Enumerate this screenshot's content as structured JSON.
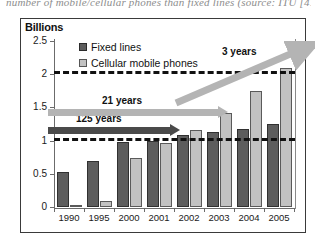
{
  "caption": "number of mobile/cellular phones than fixed lines (source: ITU [41])",
  "chart_data": {
    "type": "bar",
    "title": "",
    "ylabel": "Billions",
    "xlabel": "",
    "ylim": [
      0,
      2.5
    ],
    "yticks": [
      "0",
      "0.5",
      "1",
      "1.5",
      "2",
      "2.5"
    ],
    "ytick_values": [
      0,
      0.5,
      1,
      1.5,
      2,
      2.5
    ],
    "grid": false,
    "legend_position": "top-left-inside",
    "categories": [
      "1990",
      "1995",
      "2000",
      "2001",
      "2002",
      "2003",
      "2004",
      "2005"
    ],
    "series": [
      {
        "name": "Fixed lines",
        "color": "#5d5d5d",
        "values": [
          0.52,
          0.69,
          0.98,
          1.0,
          1.08,
          1.13,
          1.18,
          1.25
        ]
      },
      {
        "name": "Cellular mobile phones",
        "color": "#c2c2c2",
        "values": [
          0.01,
          0.09,
          0.74,
          0.97,
          1.16,
          1.42,
          1.75,
          2.1
        ]
      }
    ],
    "reference_lines": [
      {
        "value": 1,
        "style": "dashed",
        "color": "#111111"
      },
      {
        "value": 2,
        "style": "dashed",
        "color": "#111111"
      }
    ],
    "annotations": [
      {
        "label": "125 years",
        "style": "horizontal-arrow-dark",
        "at_value": 1
      },
      {
        "label": "21 years",
        "style": "horizontal-arrow-light",
        "at_value": 1
      },
      {
        "label": "3 years",
        "style": "diagonal-arrow-light",
        "at_value": 2
      }
    ]
  }
}
